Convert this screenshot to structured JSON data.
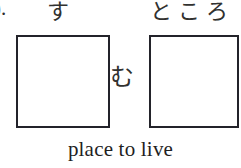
{
  "exercise": {
    "list_marker": ").",
    "reading_above_box_1": "す",
    "connector_kana": "む",
    "reading_above_box_2": "ところ",
    "translation": "place to live",
    "box_1_value": "",
    "box_2_value": ""
  },
  "colors": {
    "page_background": "#ffffff",
    "box_border": "#23232a",
    "kana_ink": "#31312f",
    "caption_ink": "#1f1f1f",
    "marker_ink": "#2b2b2b"
  }
}
